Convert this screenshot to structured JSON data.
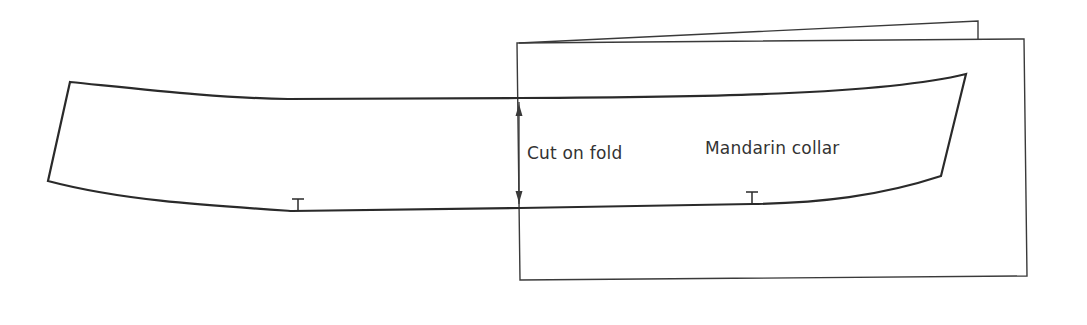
{
  "diagram": {
    "type": "sewing-pattern",
    "labels": {
      "fold": "Cut on fold",
      "piece": "Mandarin collar"
    },
    "elements": [
      {
        "name": "collar-pattern-piece",
        "shape": "curved band"
      },
      {
        "name": "fold-line-arrow",
        "shape": "double-headed vertical arrow"
      },
      {
        "name": "folded-paper",
        "shape": "folded sheet (two layers)"
      },
      {
        "name": "notch-marks",
        "count": 2
      }
    ],
    "colors": {
      "line": "#2a2a2a",
      "text": "#333333",
      "background": "#ffffff"
    }
  }
}
